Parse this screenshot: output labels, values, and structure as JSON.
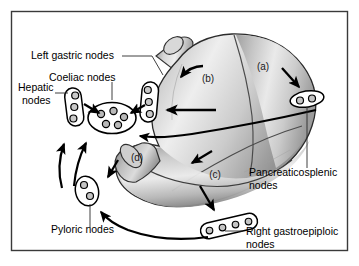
{
  "figure": {
    "frame_color": "#3a3a3a",
    "background_color": "#ffffff",
    "line_color": "#000000",
    "organ_fill_light": "#f2f2f2",
    "organ_fill_mid": "#c9c9c9",
    "organ_fill_dark": "#8f8f8f"
  },
  "labels": {
    "left_gastric": "Left gastric nodes",
    "coeliac": "Coeliac nodes",
    "hepatic_line1": "Hepatic",
    "hepatic_line2": "nodes",
    "pancreaticosplenic_line1": "Pancreaticosplenic",
    "pancreaticosplenic_line2": "nodes",
    "right_gastroepiploic_line1": "Right gastroepiploic",
    "right_gastroepiploic_line2": "nodes",
    "pyloric": "Pyloric nodes"
  },
  "regions": {
    "a": "(a)",
    "b": "(b)",
    "c": "(c)",
    "d": "(d)"
  },
  "node_groups": [
    {
      "id": "hepatic",
      "shape": "vertical-capsule",
      "node_count": 3
    },
    {
      "id": "left-gastric",
      "shape": "vertical-capsule",
      "node_count": 3
    },
    {
      "id": "coeliac",
      "shape": "large-oval",
      "node_count": 5
    },
    {
      "id": "pancreaticosplenic",
      "shape": "small-oval",
      "node_count": 2
    },
    {
      "id": "right-gastroepiploic",
      "shape": "elongated-capsule",
      "node_count": 4
    },
    {
      "id": "pyloric",
      "shape": "small-oval",
      "node_count": 2
    }
  ]
}
